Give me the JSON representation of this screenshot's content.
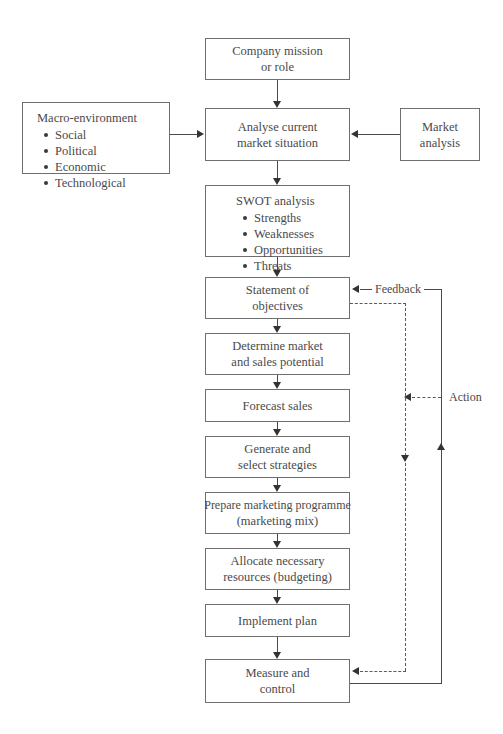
{
  "diagram": {
    "text_color": "#4a4a4a",
    "border_color": "#6f6f6f",
    "line_color": "#4a4a4a",
    "background": "#ffffff"
  },
  "nodes": {
    "company_mission": {
      "line1": "Company mission",
      "line2": "or role"
    },
    "analyse_current": {
      "line1": "Analyse current",
      "line2": "market situation"
    },
    "macro_environment": {
      "heading": "Macro-environment",
      "items": [
        "Social",
        "Political",
        "Economic",
        "Technological"
      ]
    },
    "market_analysis": {
      "line1": "Market",
      "line2": "analysis"
    },
    "swot": {
      "heading": "SWOT analysis",
      "items": [
        "Strengths",
        "Weaknesses",
        "Opportunities",
        "Threats"
      ]
    },
    "statement_objectives": {
      "line1": "Statement of",
      "line2": "objectives"
    },
    "determine_market": {
      "line1": "Determine market",
      "line2": "and sales potential"
    },
    "forecast_sales": {
      "line1": "Forecast sales",
      "line2": ""
    },
    "generate_strategies": {
      "line1": "Generate and",
      "line2": "select strategies"
    },
    "prepare_programme": {
      "line1": "Prepare marketing programme",
      "line2": "(marketing mix)"
    },
    "allocate_resources": {
      "line1": "Allocate necessary",
      "line2": "resources (budgeting)"
    },
    "implement_plan": {
      "line1": "Implement plan",
      "line2": ""
    },
    "measure_control": {
      "line1": "Measure and",
      "line2": "control"
    }
  },
  "loops": {
    "feedback_label": "Feedback",
    "action_label": "Action"
  }
}
